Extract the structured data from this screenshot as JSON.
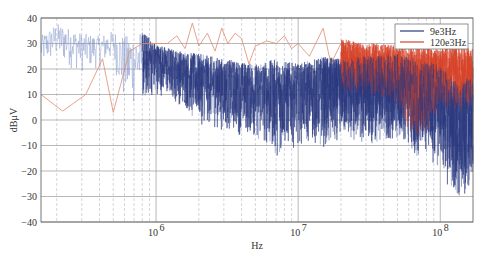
{
  "chart_data": {
    "type": "line",
    "title": "",
    "xlabel": "Hz",
    "ylabel": "dBμV",
    "xscale": "log",
    "xlim": [
      155000,
      170000000
    ],
    "ylim": [
      -40,
      40
    ],
    "grid": true,
    "legend_position": "upper right",
    "x_ticks": [
      {
        "value": 1000000,
        "base": "10",
        "exp": "6"
      },
      {
        "value": 10000000,
        "base": "10",
        "exp": "7"
      },
      {
        "value": 100000000,
        "base": "10",
        "exp": "8"
      }
    ],
    "y_ticks": [
      40,
      30,
      20,
      10,
      0,
      -10,
      -20,
      -30,
      -40
    ],
    "series": [
      {
        "name": "9e3Hz",
        "color": "#2b3a7e",
        "style": "dense-noise",
        "envelope": [
          {
            "x": 155000,
            "upper": 33,
            "lower": 20
          },
          {
            "x": 200000,
            "upper": 38,
            "lower": 22
          },
          {
            "x": 300000,
            "upper": 34,
            "lower": 18
          },
          {
            "x": 400000,
            "upper": 33,
            "lower": 20
          },
          {
            "x": 500000,
            "upper": 35,
            "lower": 22
          },
          {
            "x": 600000,
            "upper": 33,
            "lower": 2
          },
          {
            "x": 800000,
            "upper": 35,
            "lower": 5
          },
          {
            "x": 1000000,
            "upper": 30,
            "lower": 10
          },
          {
            "x": 1500000,
            "upper": 27,
            "lower": 5
          },
          {
            "x": 2000000,
            "upper": 26,
            "lower": -2
          },
          {
            "x": 3000000,
            "upper": 24,
            "lower": -5
          },
          {
            "x": 5000000,
            "upper": 22,
            "lower": -8
          },
          {
            "x": 7000000,
            "upper": 24,
            "lower": -15
          },
          {
            "x": 10000000,
            "upper": 22,
            "lower": -10
          },
          {
            "x": 15000000,
            "upper": 25,
            "lower": -12
          },
          {
            "x": 20000000,
            "upper": 24,
            "lower": -8
          },
          {
            "x": 30000000,
            "upper": 25,
            "lower": -10
          },
          {
            "x": 50000000,
            "upper": 26,
            "lower": -8
          },
          {
            "x": 70000000,
            "upper": 24,
            "lower": -15
          },
          {
            "x": 100000000,
            "upper": 22,
            "lower": -20
          },
          {
            "x": 130000000,
            "upper": 15,
            "lower": -35
          },
          {
            "x": 170000000,
            "upper": 18,
            "lower": -25
          }
        ]
      },
      {
        "name": "120e3Hz",
        "color": "#d5432a",
        "style": "line-then-dense",
        "points": [
          [
            155000,
            10
          ],
          [
            220000,
            3.5
          ],
          [
            320000,
            10
          ],
          [
            420000,
            24
          ],
          [
            500000,
            3
          ],
          [
            650000,
            27
          ],
          [
            800000,
            30
          ],
          [
            1000000,
            30
          ],
          [
            1200000,
            30
          ],
          [
            1400000,
            33
          ],
          [
            1600000,
            28
          ],
          [
            1800000,
            38
          ],
          [
            2000000,
            29
          ],
          [
            2300000,
            34
          ],
          [
            2600000,
            27
          ],
          [
            2900000,
            36
          ],
          [
            3200000,
            30
          ],
          [
            3600000,
            34
          ],
          [
            4000000,
            32
          ],
          [
            4500000,
            22
          ],
          [
            5000000,
            29
          ],
          [
            6000000,
            31
          ],
          [
            7000000,
            30
          ],
          [
            8000000,
            33
          ],
          [
            9000000,
            28
          ],
          [
            10000000,
            30
          ],
          [
            12000000,
            25
          ],
          [
            15000000,
            36
          ],
          [
            17000000,
            22
          ],
          [
            20000000,
            30
          ]
        ],
        "envelope": [
          {
            "x": 20000000,
            "upper": 32,
            "lower": 8
          },
          {
            "x": 30000000,
            "upper": 30,
            "lower": 10
          },
          {
            "x": 40000000,
            "upper": 30,
            "lower": 8
          },
          {
            "x": 50000000,
            "upper": 29,
            "lower": 5
          },
          {
            "x": 70000000,
            "upper": 30,
            "lower": -12
          },
          {
            "x": 100000000,
            "upper": 28,
            "lower": 5
          },
          {
            "x": 130000000,
            "upper": 29,
            "lower": 2
          },
          {
            "x": 170000000,
            "upper": 28,
            "lower": 5
          }
        ]
      }
    ]
  }
}
